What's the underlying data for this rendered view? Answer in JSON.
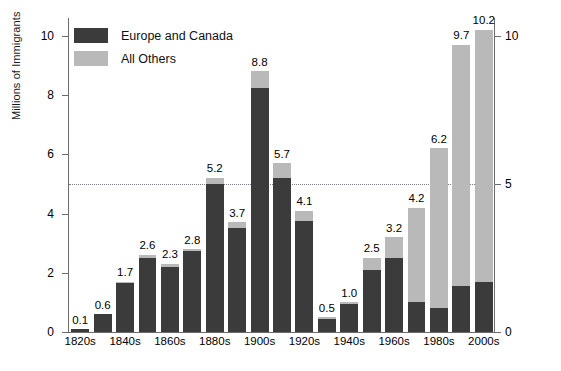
{
  "chart_data": {
    "type": "bar",
    "subtype": "stacked-bar",
    "title": "",
    "xlabel": "",
    "ylabel": "Millions of Immigrants",
    "ylim": [
      0,
      10.6
    ],
    "yticks_left": [
      0,
      2,
      4,
      6,
      8,
      10
    ],
    "yticks_right": [
      0,
      5,
      10
    ],
    "grid": false,
    "reference_line": {
      "value": 5,
      "style": "dotted"
    },
    "legend_position": "upper-left",
    "categories": [
      "1820s",
      "1830s",
      "1840s",
      "1850s",
      "1860s",
      "1870s",
      "1880s",
      "1890s",
      "1900s",
      "1910s",
      "1920s",
      "1930s",
      "1940s",
      "1950s",
      "1960s",
      "1970s",
      "1980s",
      "1990s",
      "2000s"
    ],
    "tick_labels": [
      "1820s",
      "1840s",
      "1860s",
      "1880s",
      "1900s",
      "1920s",
      "1940s",
      "1960s",
      "1980s",
      "2000s"
    ],
    "totals": [
      0.1,
      0.6,
      1.7,
      2.6,
      2.3,
      2.8,
      5.2,
      3.7,
      8.8,
      5.7,
      4.1,
      0.5,
      1.0,
      2.5,
      3.2,
      4.2,
      6.2,
      9.7,
      10.2
    ],
    "series": [
      {
        "name": "Europe and Canada",
        "color": "#3b3b3b",
        "values": [
          0.1,
          0.6,
          1.65,
          2.5,
          2.2,
          2.75,
          5.0,
          3.5,
          8.25,
          5.2,
          3.75,
          0.45,
          0.95,
          2.1,
          2.5,
          1.0,
          0.8,
          1.55,
          1.7
        ]
      },
      {
        "name": "All Others",
        "color": "#b9b9b9",
        "values": [
          0.0,
          0.0,
          0.05,
          0.1,
          0.1,
          0.05,
          0.2,
          0.2,
          0.55,
          0.5,
          0.35,
          0.05,
          0.05,
          0.4,
          0.7,
          3.2,
          5.4,
          8.15,
          8.5
        ]
      }
    ],
    "data_labels": [
      "0.1",
      "0.6",
      "1.7",
      "2.6",
      "2.3",
      "2.8",
      "5.2",
      "3.7",
      "8.8",
      "5.7",
      "4.1",
      "0.5",
      "1.0",
      "2.5",
      "3.2",
      "4.2",
      "6.2",
      "9.7",
      "10.2"
    ]
  },
  "legend": {
    "items": [
      {
        "label": "Europe and Canada",
        "color": "#3b3b3b"
      },
      {
        "label": "All Others",
        "color": "#b9b9b9"
      }
    ]
  },
  "axes": {
    "y_axis_title": "Millions of Immigrants",
    "left_tick_labels": [
      "10",
      "8",
      "6",
      "4",
      "2",
      "0"
    ],
    "right_tick_labels": [
      "10",
      "5",
      "0"
    ]
  }
}
